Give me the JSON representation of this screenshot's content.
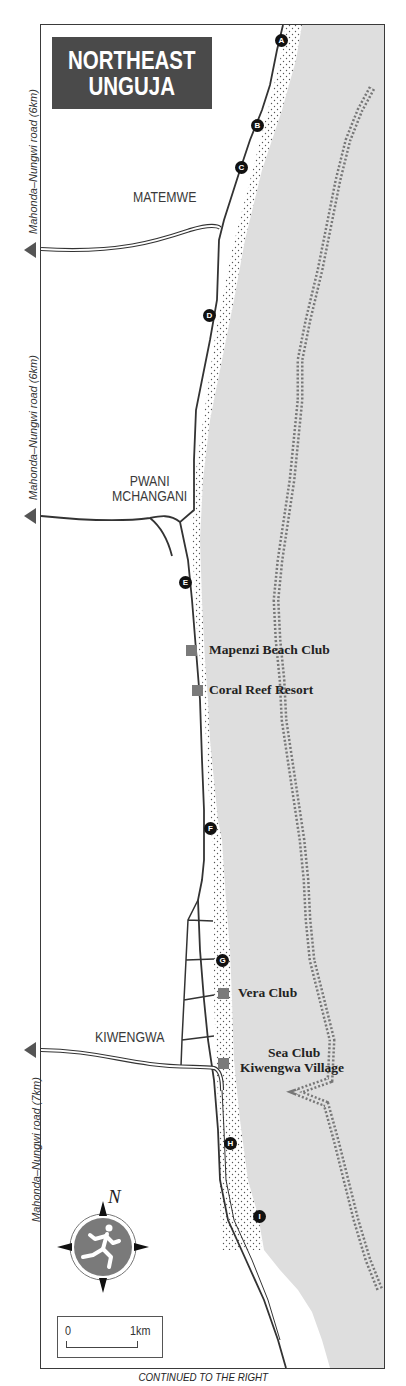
{
  "map": {
    "title_lines": [
      "NORTHEAST",
      "UNGUJA"
    ],
    "colors": {
      "sea": "#dedede",
      "title_bg": "#4a4a4a",
      "hotel_marker": "#7a7a7a",
      "pin": "#111111",
      "compass_disc": "#7a7a7a"
    },
    "towns": [
      {
        "name": "MATEMWE"
      },
      {
        "name": "PWANI\nMCHANGANI",
        "lines": [
          "PWANI",
          "MCHANGANI"
        ]
      },
      {
        "name": "KIWENGWA"
      }
    ],
    "hotels": [
      {
        "name": "Mapenzi Beach Club"
      },
      {
        "name": "Coral Reef Resort"
      },
      {
        "name": "Vera Club"
      },
      {
        "name": "Sea Club"
      },
      {
        "name": "Kiwengwa Village"
      }
    ],
    "pins": [
      "A",
      "B",
      "C",
      "D",
      "E",
      "F",
      "G",
      "H",
      "I"
    ],
    "road_labels": [
      {
        "text": "Mahonda–Nungwi road (6km)"
      },
      {
        "text": "Mahonda–Nungwi road (6km)"
      },
      {
        "text": "Mahonda–Nungwi road (7km)"
      }
    ],
    "compass": {
      "north_label": "N",
      "icon": "running-figure-compass-icon"
    },
    "scale": {
      "start": "0",
      "end": "1km"
    },
    "footer": "CONTINUED TO THE RIGHT"
  }
}
